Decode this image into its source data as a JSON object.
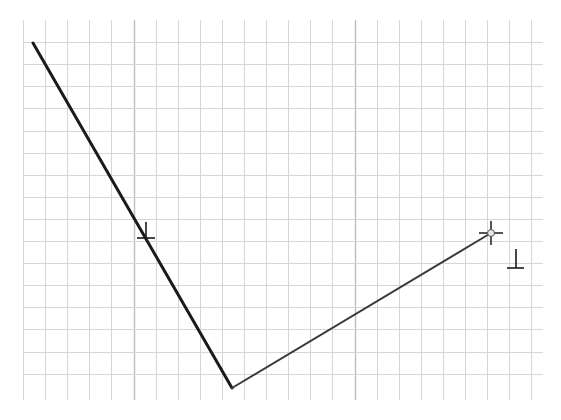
{
  "canvas": {
    "width": 561,
    "height": 420,
    "background": "#ffffff"
  },
  "grid": {
    "x_start": 23,
    "x_end": 543,
    "y_start": 20,
    "y_end": 400,
    "spacing": 22.1,
    "minor_color": "#d6d6d6",
    "major_color": "#bdbdbd",
    "major_x": [
      133,
      353
    ],
    "major_y": [
      112
    ]
  },
  "lines": [
    {
      "id": "thick-segment",
      "x1": 33,
      "y1": 43,
      "x2": 232,
      "y2": 388,
      "color": "#1a1a1a",
      "width": 3
    },
    {
      "id": "thin-segment",
      "x1": 232,
      "y1": 388,
      "x2": 491,
      "y2": 233,
      "color": "#3a3a3a",
      "width": 2
    }
  ],
  "markers": {
    "perpendicular_on_line": {
      "x": 146,
      "y": 238,
      "glyph": "perpendicular-icon"
    },
    "cursor_crosshair": {
      "x": 491,
      "y": 233,
      "glyph": "crosshair-icon"
    },
    "perpendicular_snap": {
      "x": 516,
      "y": 268,
      "glyph": "perpendicular-icon"
    }
  }
}
